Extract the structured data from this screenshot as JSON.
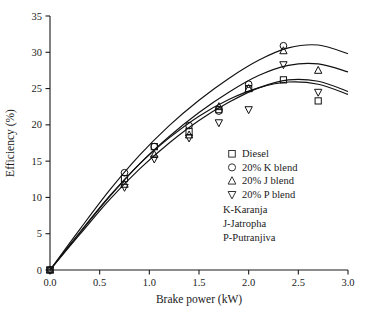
{
  "chart_data": {
    "type": "scatter",
    "title": "",
    "xlabel": "Brake power (kW)",
    "ylabel": "Efficiency (%)",
    "xlim": [
      0.0,
      3.0
    ],
    "ylim": [
      0,
      35
    ],
    "xticks": [
      "0.0",
      "0.5",
      "1.0",
      "1.5",
      "2.0",
      "2.5",
      "3.0"
    ],
    "xtick_values": [
      0.0,
      0.5,
      1.0,
      1.5,
      2.0,
      2.5,
      3.0
    ],
    "yticks": [
      "0",
      "5",
      "10",
      "15",
      "20",
      "25",
      "30",
      "35"
    ],
    "ytick_values": [
      0,
      5,
      10,
      15,
      20,
      25,
      30,
      35
    ],
    "grid": false,
    "legend_position": "inside-lower-right",
    "series": [
      {
        "name": "Diesel",
        "marker": "square",
        "x": [
          0.0,
          0.75,
          1.05,
          1.4,
          1.7,
          2.0,
          2.35,
          2.7
        ],
        "y": [
          0.0,
          12.6,
          17.0,
          19.1,
          22.1,
          25.0,
          26.2,
          23.3
        ]
      },
      {
        "name": "20% K blend",
        "marker": "circle",
        "x": [
          0.0,
          0.75,
          1.05,
          1.4,
          1.7,
          2.0,
          2.35
        ],
        "y": [
          0.0,
          13.4,
          17.0,
          19.9,
          21.9,
          25.6,
          30.9
        ]
      },
      {
        "name": "20% J blend",
        "marker": "triangle-up",
        "x": [
          0.0,
          0.75,
          1.05,
          1.4,
          1.7,
          2.0,
          2.35,
          2.7
        ],
        "y": [
          0.0,
          11.8,
          15.9,
          18.6,
          22.5,
          25.0,
          30.2,
          27.5
        ]
      },
      {
        "name": "20% P blend",
        "marker": "triangle-down",
        "x": [
          0.0,
          0.75,
          1.05,
          1.4,
          1.7,
          2.0,
          2.35,
          2.7
        ],
        "y": [
          0.0,
          11.4,
          15.3,
          18.2,
          20.3,
          22.1,
          28.3,
          24.5
        ]
      }
    ],
    "fit_curves": [
      {
        "name": "Diesel",
        "points": [
          [
            0.0,
            0.0
          ],
          [
            0.3,
            5.2
          ],
          [
            0.6,
            10.2
          ],
          [
            0.9,
            14.6
          ],
          [
            1.2,
            18.2
          ],
          [
            1.5,
            21.2
          ],
          [
            1.8,
            23.5
          ],
          [
            2.1,
            25.1
          ],
          [
            2.4,
            25.9
          ],
          [
            2.7,
            25.6
          ],
          [
            3.0,
            24.2
          ]
        ]
      },
      {
        "name": "20% K blend",
        "points": [
          [
            0.0,
            0.0
          ],
          [
            0.3,
            5.6
          ],
          [
            0.6,
            11.0
          ],
          [
            0.9,
            15.8
          ],
          [
            1.2,
            19.9
          ],
          [
            1.5,
            23.4
          ],
          [
            1.8,
            26.4
          ],
          [
            2.1,
            28.9
          ],
          [
            2.4,
            30.6
          ],
          [
            2.7,
            31.0
          ],
          [
            3.0,
            29.8
          ]
        ]
      },
      {
        "name": "20% J blend",
        "points": [
          [
            0.0,
            0.0
          ],
          [
            0.3,
            5.1
          ],
          [
            0.6,
            10.1
          ],
          [
            0.9,
            14.6
          ],
          [
            1.2,
            18.4
          ],
          [
            1.5,
            21.7
          ],
          [
            1.8,
            24.5
          ],
          [
            2.1,
            26.8
          ],
          [
            2.4,
            28.2
          ],
          [
            2.7,
            28.4
          ],
          [
            3.0,
            27.3
          ]
        ]
      },
      {
        "name": "20% P blend",
        "points": [
          [
            0.0,
            0.0
          ],
          [
            0.3,
            4.9
          ],
          [
            0.6,
            9.7
          ],
          [
            0.9,
            13.9
          ],
          [
            1.2,
            17.5
          ],
          [
            1.5,
            20.6
          ],
          [
            1.8,
            23.1
          ],
          [
            2.1,
            25.1
          ],
          [
            2.4,
            26.2
          ],
          [
            2.7,
            26.0
          ],
          [
            3.0,
            24.6
          ]
        ]
      }
    ],
    "legend": {
      "entries": [
        {
          "marker": "square",
          "label": "Diesel"
        },
        {
          "marker": "circle",
          "label": "20% K blend"
        },
        {
          "marker": "triangle-up",
          "label": "20% J blend"
        },
        {
          "marker": "triangle-down",
          "label": "20% P blend"
        }
      ],
      "notes": [
        "K-Karanja",
        "J-Jatropha",
        "P-Putranjiva"
      ]
    },
    "colors": {
      "axis": "#1a1a1a",
      "curve": "#111111",
      "marker": "#111111",
      "background": "#ffffff"
    }
  }
}
